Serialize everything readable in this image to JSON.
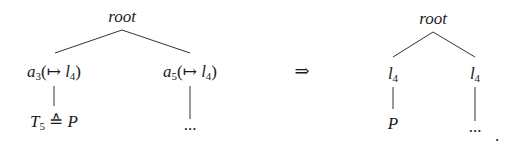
{
  "diagram": {
    "type": "tree-transformation",
    "arrow": "⇒",
    "trailing_punctuation": ".",
    "left_tree": {
      "root": "root",
      "children": [
        {
          "label_var": "a",
          "label_sub": "3",
          "label_suffix": "(↦ ",
          "label_target_var": "l",
          "label_target_sub": "4",
          "label_close": ")",
          "child": {
            "var": "T",
            "sub": "5",
            "op": " ≙ ",
            "rhs": "P"
          }
        },
        {
          "label_var": "a",
          "label_sub": "5",
          "label_suffix": "(↦ ",
          "label_target_var": "l",
          "label_target_sub": "4",
          "label_close": ")",
          "child": {
            "text": "..."
          }
        }
      ]
    },
    "right_tree": {
      "root": "root",
      "children": [
        {
          "label_var": "l",
          "label_sub": "4",
          "child": {
            "text": "P"
          }
        },
        {
          "label_var": "l",
          "label_sub": "4",
          "child": {
            "text": "..."
          }
        }
      ]
    },
    "colors": {
      "ink": "#1a1a1a",
      "edge": "#333333",
      "background": "#ffffff"
    }
  }
}
